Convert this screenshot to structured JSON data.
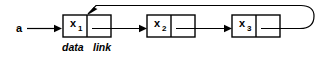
{
  "diagram": {
    "type": "linked-list",
    "background_color": "#ffffff",
    "stroke_color": "#000000",
    "head_pointer": {
      "label": "a",
      "target": "node-1"
    },
    "field_captions": {
      "data": "data",
      "link": "link"
    },
    "nodes": [
      {
        "id": "node-1",
        "value": "x",
        "subscript": "1",
        "data_field": "x",
        "link_target": "node-2"
      },
      {
        "id": "node-2",
        "value": "x",
        "subscript": "2",
        "data_field": "x",
        "link_target": "node-3"
      },
      {
        "id": "node-3",
        "value": "x",
        "subscript": "3",
        "data_field": "x",
        "link_target": "node-1"
      }
    ],
    "loop_back": {
      "from": "node-3",
      "to": "node-1",
      "description": "link of last node wraps around to first node"
    }
  }
}
